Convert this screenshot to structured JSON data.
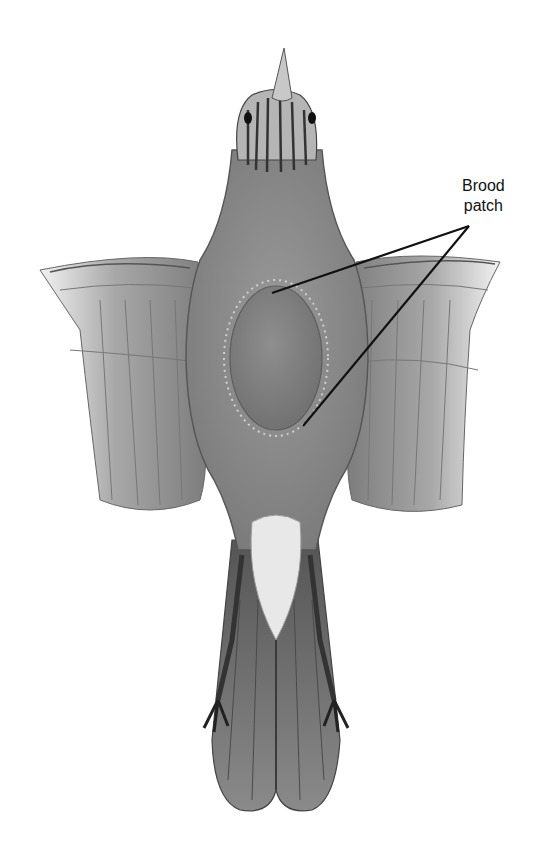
{
  "figure": {
    "style": "grayscale pencil illustration",
    "colors": {
      "background": "#ffffff",
      "body": "#8a8a8a",
      "patch": "#7a7a7a",
      "wing": "#9a9a9a",
      "tail": "#6e6e6e",
      "undertail": "#e8e8e8",
      "leader_line": "#111111",
      "label_text": "#111111"
    }
  },
  "callout": {
    "label_line1": "Brood",
    "label_line2": "patch",
    "anchor": {
      "x": 469,
      "y": 226
    },
    "targets": [
      {
        "x": 272,
        "y": 293
      },
      {
        "x": 303,
        "y": 426
      }
    ]
  }
}
